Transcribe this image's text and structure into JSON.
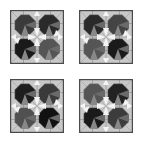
{
  "figure": {
    "layout": "2x2 grid of tiled geometric patterns",
    "panels": [
      {
        "id": "top-left",
        "blobs": [
          "#3a3a3a",
          "#2a2a2a",
          "#1a1a1a",
          "#555555"
        ]
      },
      {
        "id": "top-right",
        "blobs": [
          "#2a2a2a",
          "#444444",
          "#555555",
          "#1a1a1a"
        ]
      },
      {
        "id": "bottom-left",
        "blobs": [
          "#1e1e1e",
          "#3a3a3a",
          "#505050",
          "#111111"
        ]
      },
      {
        "id": "bottom-right",
        "blobs": [
          "#555555",
          "#222222",
          "#1a1a1a",
          "#3c3c3c"
        ]
      }
    ],
    "colors": {
      "background": "#ffffff",
      "frame": "#4a4a4a",
      "tile_light": "#c8c8c8",
      "tile_mid": "#8a8a8a",
      "white_petal": "#f4f4f4"
    }
  }
}
